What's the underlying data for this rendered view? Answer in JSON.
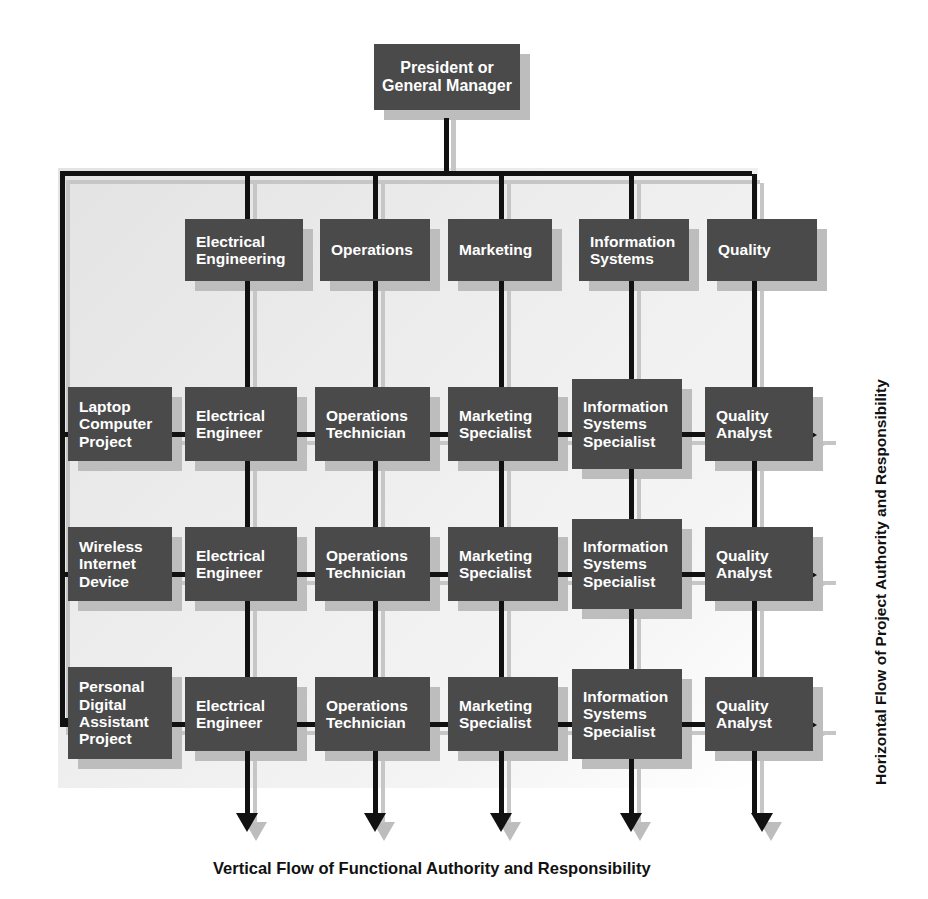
{
  "diagram": {
    "colors": {
      "box_fill": "#4a4a4a",
      "box_text": "#ffffff",
      "line_black": "#111111",
      "line_gray": "#c6c6c6",
      "shadow": "#bdbdbd",
      "background": "#ffffff"
    }
  },
  "top": {
    "lines": [
      "President or",
      "General Manager"
    ]
  },
  "functions": [
    {
      "lines": [
        "Electrical",
        "Engineering"
      ]
    },
    {
      "lines": [
        "Operations"
      ]
    },
    {
      "lines": [
        "Marketing"
      ]
    },
    {
      "lines": [
        "Information",
        "Systems"
      ]
    },
    {
      "lines": [
        "Quality"
      ]
    }
  ],
  "projects": [
    {
      "lines": [
        "Laptop",
        "Computer",
        "Project"
      ]
    },
    {
      "lines": [
        "Wireless",
        "Internet",
        "Device"
      ]
    },
    {
      "lines": [
        "Personal",
        "Digital",
        "Assistant",
        "Project"
      ]
    }
  ],
  "roles": [
    [
      {
        "lines": [
          "Electrical",
          "Engineer"
        ]
      },
      {
        "lines": [
          "Operations",
          "Technician"
        ]
      },
      {
        "lines": [
          "Marketing",
          "Specialist"
        ]
      },
      {
        "lines": [
          "Information",
          "Systems",
          "Specialist"
        ]
      },
      {
        "lines": [
          "Quality",
          "Analyst"
        ]
      }
    ],
    [
      {
        "lines": [
          "Electrical",
          "Engineer"
        ]
      },
      {
        "lines": [
          "Operations",
          "Technician"
        ]
      },
      {
        "lines": [
          "Marketing",
          "Specialist"
        ]
      },
      {
        "lines": [
          "Information",
          "Systems",
          "Specialist"
        ]
      },
      {
        "lines": [
          "Quality",
          "Analyst"
        ]
      }
    ],
    [
      {
        "lines": [
          "Electrical",
          "Engineer"
        ]
      },
      {
        "lines": [
          "Operations",
          "Technician"
        ]
      },
      {
        "lines": [
          "Marketing",
          "Specialist"
        ]
      },
      {
        "lines": [
          "Information",
          "Systems",
          "Specialist"
        ]
      },
      {
        "lines": [
          "Quality",
          "Analyst"
        ]
      }
    ]
  ],
  "captions": {
    "vertical_flow": "Vertical Flow of Functional Authority and Responsibility",
    "horizontal_flow": "Horizontal Flow of Project Authority and Responsibility"
  }
}
